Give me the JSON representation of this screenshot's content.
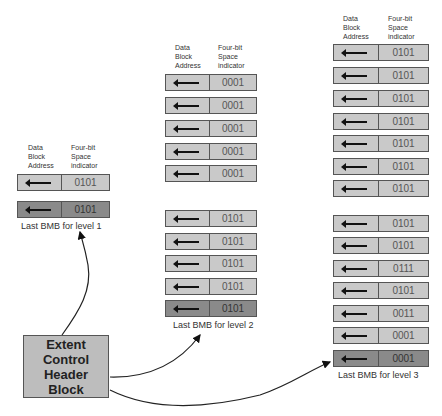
{
  "headers": {
    "address": [
      "Data",
      "Block",
      "Address"
    ],
    "indicator": [
      "Four-bit",
      "Space",
      "indicator"
    ]
  },
  "level1": {
    "caption": "Last BMB for level 1",
    "rows": [
      "0101",
      "0101"
    ]
  },
  "level2": {
    "caption": "Last BMB for level 2",
    "group1": [
      "0001",
      "0001",
      "0001",
      "0001",
      "0001"
    ],
    "group2": [
      "0101",
      "0101",
      "0101",
      "0101",
      "0101"
    ]
  },
  "level3": {
    "caption": "Last BMB for level 3",
    "group1": [
      "0101",
      "0101",
      "0101",
      "0101",
      "0101",
      "0101",
      "0101"
    ],
    "group2": [
      "0101",
      "0101",
      "0111",
      "0101",
      "0011",
      "0001",
      "0001"
    ]
  },
  "extent_block": {
    "lines": [
      "Extent",
      "Control",
      "Header",
      "Block"
    ]
  },
  "colors": {
    "bmb_fill": "#c9c9c9",
    "last_bmb_fill": "#8a8a8a",
    "extent_fill": "#bdbdbd"
  }
}
